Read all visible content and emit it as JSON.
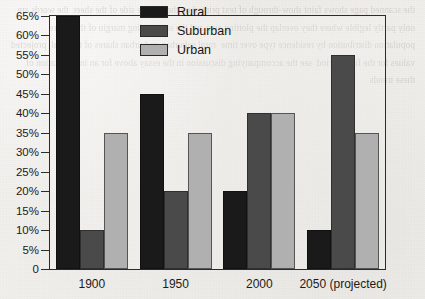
{
  "chart_data": {
    "type": "bar",
    "title": "",
    "subtitle": "",
    "xlabel": "",
    "ylabel": "",
    "categories": [
      "1900",
      "1950",
      "2000",
      "2050 (projected)"
    ],
    "series": [
      {
        "name": "Rural",
        "values": [
          65,
          45,
          20,
          10
        ],
        "color": "#1a1a1a"
      },
      {
        "name": "Suburban",
        "values": [
          10,
          20,
          40,
          55
        ],
        "color": "#4a4a4a"
      },
      {
        "name": "Urban",
        "values": [
          35,
          35,
          40,
          35
        ],
        "color": "#b0b0b0"
      }
    ],
    "ylim": [
      0,
      65
    ],
    "ytick_values": [
      65,
      60,
      55,
      50,
      45,
      40,
      35,
      30,
      25,
      20,
      15,
      10,
      5,
      0
    ],
    "ytick_labels": [
      "65%",
      "60%",
      "55%",
      "50%",
      "45%",
      "40%",
      "35%",
      "30%",
      "25%",
      "20%",
      "15%",
      "10%",
      "5%",
      "0"
    ],
    "grid": false,
    "legend_position": "top-center-right",
    "annotations": []
  },
  "legend": {
    "entries": [
      {
        "label": "Rural",
        "color": "#1a1a1a"
      },
      {
        "label": "Suburban",
        "color": "#4a4a4a"
      },
      {
        "label": "Urban",
        "color": "#b0b0b0"
      }
    ]
  },
  "background": {
    "paper_color": "#f1efeb",
    "axis_color": "#2e2b28",
    "bleed_text": "the scanned page shows faint show-through of text printed on the reverse side of the sheet  the words are only partly legible where they overlap the plotting area and the surrounding margin of the figure  population distribution by residence type over time  rural suburban and urban shares of the total  projected values for the final period  see the accompanying discussion in the essay above for an interpretation of these trends"
  }
}
